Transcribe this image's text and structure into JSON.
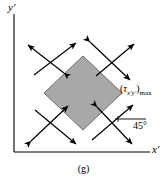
{
  "figure": {
    "caption": "(g)",
    "background_color": "#ffffff",
    "stroke_color": "#000000",
    "element_fill_color": "#a8a8a8",
    "element_edge_color": "#6e6e6e"
  },
  "axes": {
    "y_label": "y′",
    "x_label": "x′",
    "origin": {
      "x": 14,
      "y": 152
    },
    "y_top": 14,
    "x_right": 150
  },
  "element": {
    "name": "rotated-stress-element",
    "shape": "diamond",
    "rotation_deg": 45,
    "center": {
      "x": 83,
      "y": 93
    },
    "half_diagonal_x": 39,
    "half_diagonal_y": 37
  },
  "annotations": {
    "shear_label_open_paren": "(",
    "shear_label_tau": "τ",
    "shear_label_tau_sub": "x′y′",
    "shear_label_close_paren": ")",
    "shear_label_max_sub": "max",
    "shear_label_full": "(τx′y′)max",
    "angle_value": "45°"
  },
  "arrows": {
    "type": "double-headed-shear-arrows",
    "count": 8,
    "description": "pairs of crossed double-headed arrows at each of the four faces, oriented along the 45° directions"
  }
}
